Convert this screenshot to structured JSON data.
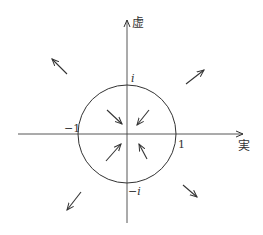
{
  "diagram": {
    "axes": {
      "real_label": "実",
      "imag_label": "虚"
    },
    "ticks": {
      "one": "1",
      "minus_one": "−1",
      "i": "i",
      "minus_i": "−i"
    },
    "circle": {
      "center": "0",
      "radius": 1
    },
    "arrows": {
      "inside": [
        "toward origin (upper-left)",
        "toward origin (upper-right)",
        "toward origin (lower-left)",
        "toward origin (lower-right)"
      ],
      "outside": [
        "away from origin (upper-left)",
        "away from origin (upper-right)",
        "away from origin (lower-left)",
        "away from origin (lower-right)"
      ]
    },
    "colors": {
      "stroke": "#333333",
      "background": "#ffffff"
    }
  }
}
